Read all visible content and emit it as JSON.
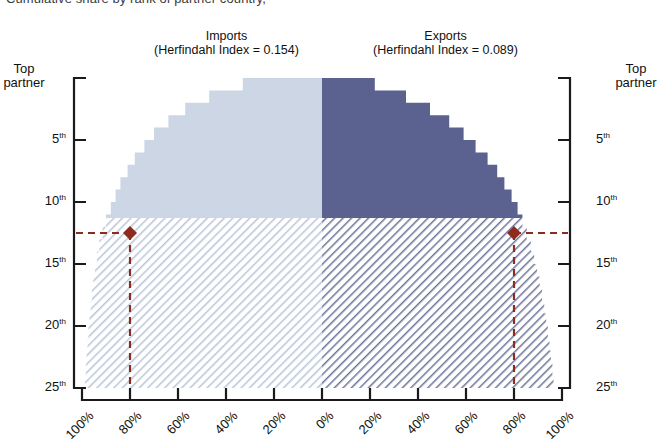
{
  "figure": {
    "clipped_title": "Cumulative share by rank of partner country,",
    "panels": [
      {
        "name": "Imports",
        "hhi_text": "(Herfindahl Index = 0.154)",
        "hhi_value": 0.154,
        "side": "left",
        "color": "#ccd6e4"
      },
      {
        "name": "Exports",
        "hhi_text": "(Herfindahl Index = 0.089)",
        "hhi_value": 0.089,
        "side": "right",
        "color": "#5b628f"
      }
    ],
    "axis_titles": {
      "left": "Top partner",
      "right": "Top partner"
    },
    "marker_color": "#8c2b1e",
    "hatch_color_left": "#b9c6d8",
    "hatch_color_right": "#6d7498"
  },
  "chart_data": {
    "type": "area",
    "title": "Cumulative share by rank of partner country,",
    "xlabel": "",
    "ylabel": "Top partner",
    "orientation": "horizontal-butterfly",
    "grid": false,
    "legend_position": "top",
    "xlim": [
      -100,
      100
    ],
    "ylim": [
      1,
      25
    ],
    "xtick_labels": [
      "100%",
      "80%",
      "60%",
      "40%",
      "20%",
      "0%",
      "20%",
      "40%",
      "60%",
      "80%",
      "100%"
    ],
    "xtick_values": [
      -100,
      -80,
      -60,
      -40,
      -20,
      0,
      20,
      40,
      60,
      80,
      100
    ],
    "ytick_labels": [
      "Top partner",
      "5th",
      "10th",
      "15th",
      "20th",
      "25th"
    ],
    "ytick_values": [
      1,
      5,
      10,
      15,
      20,
      25
    ],
    "highlight": {
      "rank": 12.5,
      "label": "12th",
      "imports_share": 80,
      "exports_share": 80,
      "marker_style": "diamond",
      "line_style": "dashed"
    },
    "series": [
      {
        "name": "Imports",
        "color": "#ccd6e4",
        "ranks": [
          1,
          2,
          3,
          4,
          5,
          6,
          7,
          8,
          9,
          10,
          11,
          12,
          13,
          14,
          15,
          16,
          17,
          18,
          19,
          20,
          21,
          22,
          23,
          24,
          25
        ],
        "cumulative_share": [
          33,
          47,
          57,
          64,
          70,
          74,
          78,
          81,
          84,
          86,
          88,
          90,
          91.5,
          92.8,
          93.8,
          94.6,
          95.3,
          95.9,
          96.4,
          96.9,
          97.3,
          97.7,
          98.1,
          98.4,
          98.7
        ]
      },
      {
        "name": "Exports",
        "color": "#5b628f",
        "ranks": [
          1,
          2,
          3,
          4,
          5,
          6,
          7,
          8,
          9,
          10,
          11,
          12,
          13,
          14,
          15,
          16,
          17,
          18,
          19,
          20,
          21,
          22,
          23,
          24,
          25
        ],
        "cumulative_share": [
          22,
          35,
          45,
          53,
          59,
          64,
          69,
          73,
          76,
          79,
          81.5,
          83.5,
          85.3,
          87,
          88.4,
          89.6,
          90.7,
          91.7,
          92.6,
          93.4,
          94.1,
          94.8,
          95.4,
          96,
          96.5
        ]
      }
    ],
    "shaded_region_note": "Ranks below the 12th-partner highlight line are drawn with diagonal hatching"
  }
}
